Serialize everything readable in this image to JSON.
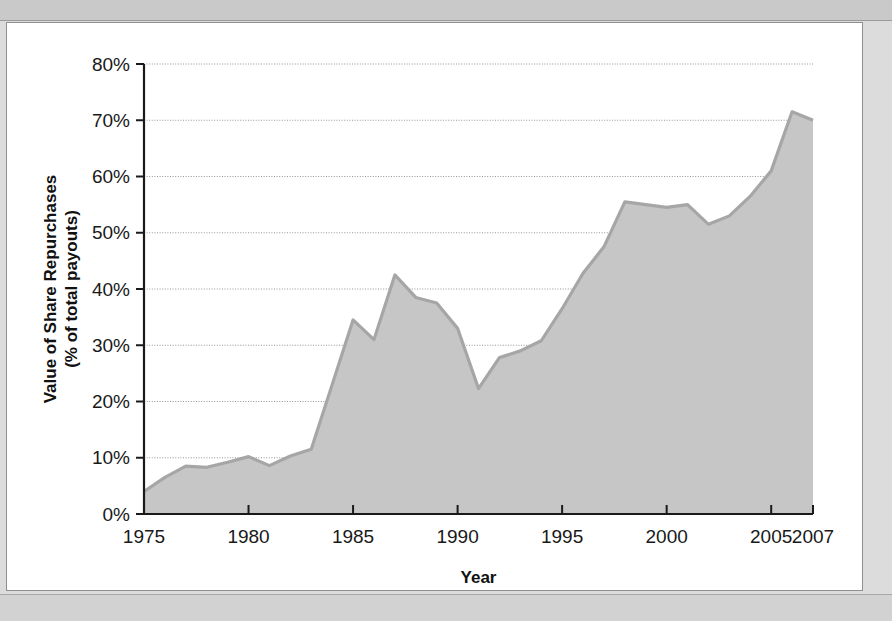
{
  "figure": {
    "panel_background": "#ffffff",
    "page_background": "#dcdcdc",
    "border_color": "#8f8f8f"
  },
  "chart_data": {
    "type": "area",
    "title": "",
    "xlabel": "Year",
    "ylabel": "Value of Share Repurchases (% of total payouts)",
    "ylabel_line1": "Value of Share Repurchases",
    "ylabel_line2": "(% of total payouts)",
    "xlim": [
      1975,
      2007
    ],
    "ylim": [
      0,
      80
    ],
    "y_tick_labels": [
      "0%",
      "10%",
      "20%",
      "30%",
      "40%",
      "50%",
      "60%",
      "70%",
      "80%"
    ],
    "y_tick_values": [
      0,
      10,
      20,
      30,
      40,
      50,
      60,
      70,
      80
    ],
    "x_tick_labels": [
      "1975",
      "1980",
      "1985",
      "1990",
      "1995",
      "2000",
      "2005",
      "2007"
    ],
    "x_tick_values": [
      1975,
      1980,
      1985,
      1990,
      1995,
      2000,
      2005,
      2007
    ],
    "grid": "horizontal",
    "legend": "none",
    "fill_color": "#c6c6c6",
    "line_color": "#a6a6a6",
    "x": [
      1975,
      1976,
      1977,
      1978,
      1979,
      1980,
      1981,
      1982,
      1983,
      1984,
      1985,
      1986,
      1987,
      1988,
      1989,
      1990,
      1991,
      1992,
      1993,
      1994,
      1995,
      1996,
      1997,
      1998,
      1999,
      2000,
      2001,
      2002,
      2003,
      2004,
      2005,
      2006,
      2007
    ],
    "values": [
      4.0,
      6.5,
      8.5,
      8.3,
      9.2,
      10.2,
      8.6,
      10.3,
      11.5,
      23.0,
      34.5,
      31.0,
      42.5,
      38.5,
      37.5,
      33.0,
      22.3,
      27.8,
      29.0,
      30.8,
      36.5,
      42.8,
      47.5,
      55.5,
      55.0,
      54.5,
      55.0,
      51.5,
      53.0,
      56.5,
      61.0,
      71.5,
      70.0
    ],
    "series_name": "Value of Share Repurchases"
  }
}
